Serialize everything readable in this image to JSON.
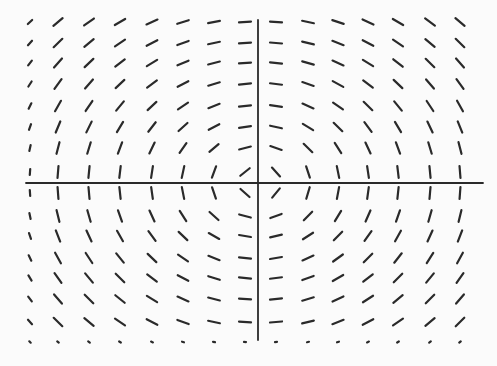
{
  "diagram": {
    "type": "slope_field",
    "colors": {
      "background": "#fbfbfb",
      "ink": "#2a2a2a"
    },
    "axes": {
      "origin_px": [
        258,
        183
      ],
      "x_axis": {
        "from_px": 26,
        "to_px": 483
      },
      "y_axis": {
        "from_px": 20,
        "to_px": 340
      }
    },
    "grid": {
      "columns_px": [
        30,
        58,
        89,
        120,
        152,
        183,
        214,
        245,
        276,
        308,
        338,
        368,
        398,
        430,
        460
      ],
      "rows_px": [
        22,
        43,
        63,
        84,
        106,
        127,
        148,
        172,
        193,
        216,
        236,
        258,
        278,
        299,
        322,
        342
      ],
      "segment_length_px": 12
    }
  }
}
